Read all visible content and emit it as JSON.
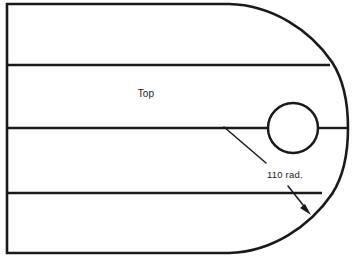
{
  "drawing": {
    "title": "Top view plate outline with radiused end",
    "background_color": "#ffffff",
    "line_color": "#1a1a1a",
    "labels": {
      "view_label": "Top",
      "radius_callout": "110 rad."
    },
    "geometry": {
      "canvas": {
        "width": 356,
        "height": 260
      },
      "body": {
        "left_edge_x": 7,
        "top_edge_y": 4,
        "bottom_edge_y": 253,
        "straight_end_x": 229,
        "arc_rightmost_x": 348,
        "centerline_y": 128
      },
      "rib_lines_y": [
        65,
        128,
        193
      ],
      "rib_line_right_x": [
        330,
        348,
        322
      ],
      "hole": {
        "center_x": 293,
        "center_y": 128,
        "radius": 25
      },
      "leader": {
        "start_x": 224,
        "start_y": 127,
        "bend_x": 266,
        "bend_y": 162,
        "arrow_start_x": 288,
        "arrow_start_y": 186,
        "arrow_tip_x": 311,
        "arrow_tip_y": 214
      },
      "label_positions": {
        "view_label_x": 146,
        "view_label_y": 97,
        "radius_callout_x": 267,
        "radius_callout_y": 178
      }
    }
  }
}
